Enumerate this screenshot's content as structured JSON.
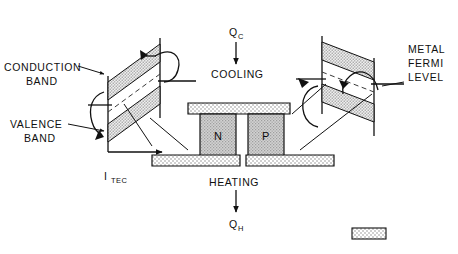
{
  "figure": {
    "type": "diagram",
    "background_color": "#ffffff",
    "line_color": "#111111",
    "stipple_fill_color": "#d8d8d8",
    "pellet_fill_color": "#c9c9c9",
    "plate_fill_color": "#ececec"
  },
  "labels": {
    "conduction_band": {
      "line1": "CONDUCTION",
      "line2": "BAND"
    },
    "valence_band": {
      "line1": "VALENCE",
      "line2": "BAND"
    },
    "metal_fermi_level": {
      "line1": "METAL",
      "line2": "FERMI",
      "line3": "LEVEL"
    },
    "cooling": "COOLING",
    "heating": "HEATING",
    "qc": {
      "symbol": "Q",
      "subscript": "C"
    },
    "qh": {
      "symbol": "Q",
      "subscript": "H"
    },
    "current": {
      "symbol": "I",
      "subscript": "TEC"
    }
  },
  "pellets": {
    "n_label": "N",
    "p_label": "P"
  },
  "legend_swatch": {
    "present": true,
    "label": ""
  }
}
